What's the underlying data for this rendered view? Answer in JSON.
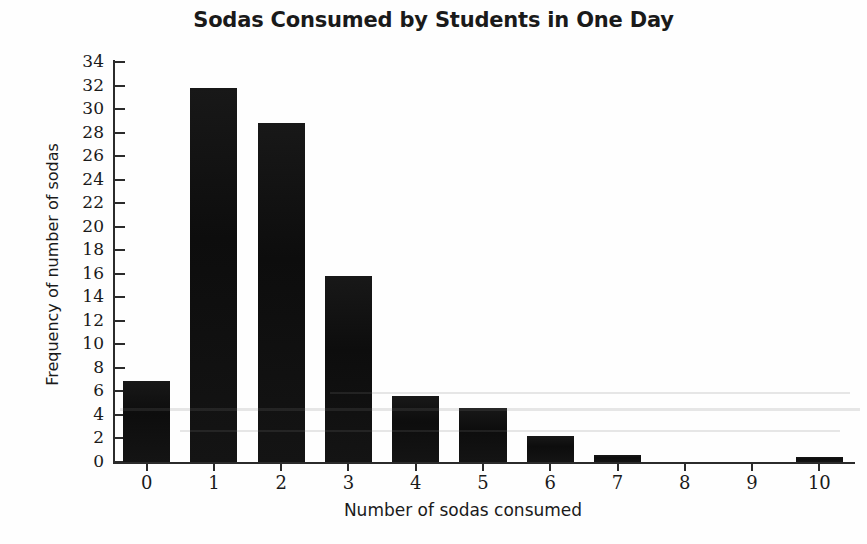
{
  "chart_data": {
    "type": "bar",
    "title": "Sodas Consumed by Students in One Day",
    "xlabel": "Number of sodas consumed",
    "ylabel": "Frequency of number of sodas",
    "categories": [
      "0",
      "1",
      "2",
      "3",
      "4",
      "5",
      "6",
      "7",
      "8",
      "9",
      "10"
    ],
    "values": [
      6.9,
      31.8,
      28.8,
      15.8,
      5.6,
      4.6,
      2.2,
      0.6,
      0,
      0,
      0.4
    ],
    "ylim": [
      0,
      34
    ],
    "xlim": [
      -0.5,
      10.5
    ],
    "ytick_labels": [
      "0",
      "2",
      "4",
      "6",
      "8",
      "10",
      "12",
      "14",
      "16",
      "18",
      "20",
      "22",
      "24",
      "26",
      "28",
      "30",
      "32",
      "34"
    ],
    "ytick_values": [
      0,
      2,
      4,
      6,
      8,
      10,
      12,
      14,
      16,
      18,
      20,
      22,
      24,
      26,
      28,
      30,
      32,
      34
    ],
    "xtick_labels": [
      "0",
      "1",
      "2",
      "3",
      "4",
      "5",
      "6",
      "7",
      "8",
      "9",
      "10"
    ],
    "grid": false,
    "legend": null,
    "bar_color": "#111111"
  },
  "chart": {
    "title": "Sodas Consumed by Students in One Day",
    "xlabel": "Number of sodas consumed",
    "ylabel": "Frequency of number of sodas"
  }
}
